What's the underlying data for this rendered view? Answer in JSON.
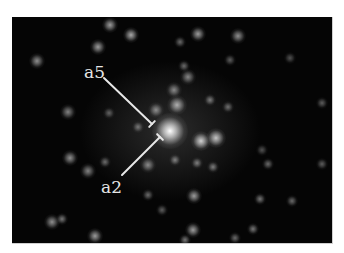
{
  "figure": {
    "background_color": "#050505",
    "annotations": [
      {
        "label": "a5",
        "label_x": 84,
        "label_y": 64,
        "line": [
          104,
          78,
          152,
          124
        ],
        "tick": "bracket"
      },
      {
        "label": "a2",
        "label_x": 101,
        "label_y": 179,
        "line": [
          122,
          175,
          160,
          137
        ],
        "tick": "bracket"
      }
    ],
    "center_spot": {
      "x": 170,
      "y": 131,
      "r": 9,
      "intensity": 1.0
    },
    "spots": [
      {
        "x": 110,
        "y": 25,
        "r": 4,
        "i": 0.6
      },
      {
        "x": 131,
        "y": 35,
        "r": 4,
        "i": 0.65
      },
      {
        "x": 98,
        "y": 47,
        "r": 4,
        "i": 0.6
      },
      {
        "x": 37,
        "y": 61,
        "r": 4,
        "i": 0.55
      },
      {
        "x": 68,
        "y": 112,
        "r": 4,
        "i": 0.5
      },
      {
        "x": 109,
        "y": 113,
        "r": 3,
        "i": 0.35
      },
      {
        "x": 198,
        "y": 34,
        "r": 4,
        "i": 0.6
      },
      {
        "x": 238,
        "y": 36,
        "r": 4,
        "i": 0.55
      },
      {
        "x": 180,
        "y": 42,
        "r": 3,
        "i": 0.4
      },
      {
        "x": 184,
        "y": 66,
        "r": 3,
        "i": 0.4
      },
      {
        "x": 188,
        "y": 77,
        "r": 4,
        "i": 0.5
      },
      {
        "x": 174,
        "y": 90,
        "r": 4,
        "i": 0.5
      },
      {
        "x": 177,
        "y": 105,
        "r": 5,
        "i": 0.65
      },
      {
        "x": 210,
        "y": 100,
        "r": 3,
        "i": 0.45
      },
      {
        "x": 228,
        "y": 107,
        "r": 3,
        "i": 0.4
      },
      {
        "x": 322,
        "y": 103,
        "r": 3,
        "i": 0.35
      },
      {
        "x": 290,
        "y": 58,
        "r": 3,
        "i": 0.3
      },
      {
        "x": 156,
        "y": 110,
        "r": 4,
        "i": 0.5
      },
      {
        "x": 138,
        "y": 127,
        "r": 3,
        "i": 0.4
      },
      {
        "x": 201,
        "y": 141,
        "r": 5,
        "i": 0.8
      },
      {
        "x": 216,
        "y": 138,
        "r": 5,
        "i": 0.75
      },
      {
        "x": 175,
        "y": 160,
        "r": 3,
        "i": 0.45
      },
      {
        "x": 197,
        "y": 163,
        "r": 3,
        "i": 0.45
      },
      {
        "x": 213,
        "y": 167,
        "r": 3,
        "i": 0.45
      },
      {
        "x": 268,
        "y": 164,
        "r": 3,
        "i": 0.4
      },
      {
        "x": 322,
        "y": 164,
        "r": 3,
        "i": 0.35
      },
      {
        "x": 194,
        "y": 196,
        "r": 4,
        "i": 0.6
      },
      {
        "x": 260,
        "y": 199,
        "r": 3,
        "i": 0.45
      },
      {
        "x": 292,
        "y": 201,
        "r": 3,
        "i": 0.4
      },
      {
        "x": 193,
        "y": 230,
        "r": 4,
        "i": 0.6
      },
      {
        "x": 253,
        "y": 229,
        "r": 3,
        "i": 0.45
      },
      {
        "x": 235,
        "y": 238,
        "r": 3,
        "i": 0.4
      },
      {
        "x": 185,
        "y": 240,
        "r": 3,
        "i": 0.45
      },
      {
        "x": 70,
        "y": 158,
        "r": 4,
        "i": 0.55
      },
      {
        "x": 105,
        "y": 162,
        "r": 3,
        "i": 0.4
      },
      {
        "x": 88,
        "y": 171,
        "r": 4,
        "i": 0.5
      },
      {
        "x": 148,
        "y": 165,
        "r": 4,
        "i": 0.5
      },
      {
        "x": 52,
        "y": 222,
        "r": 4,
        "i": 0.55
      },
      {
        "x": 62,
        "y": 219,
        "r": 3,
        "i": 0.45
      },
      {
        "x": 95,
        "y": 236,
        "r": 4,
        "i": 0.6
      },
      {
        "x": 148,
        "y": 195,
        "r": 3,
        "i": 0.4
      },
      {
        "x": 162,
        "y": 210,
        "r": 3,
        "i": 0.35
      },
      {
        "x": 230,
        "y": 60,
        "r": 3,
        "i": 0.35
      },
      {
        "x": 262,
        "y": 150,
        "r": 3,
        "i": 0.3
      }
    ]
  }
}
